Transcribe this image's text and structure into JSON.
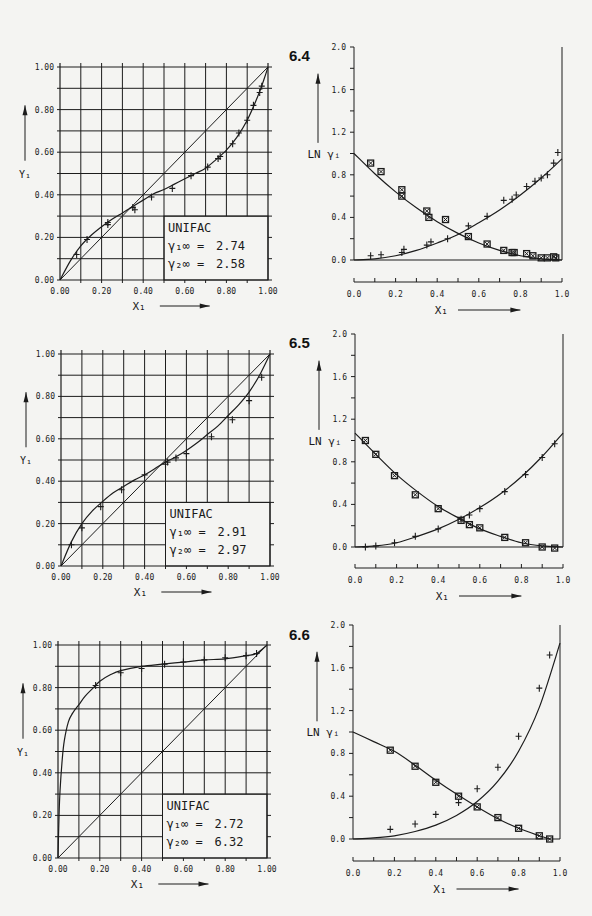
{
  "page": {
    "figures": [
      "6.4",
      "6.5",
      "6.6"
    ]
  },
  "chart_data": [
    {
      "id": "6.4-xy",
      "figure": "6.4",
      "type": "line",
      "title": "",
      "xlabel": "X₁",
      "ylabel": "Y₁",
      "xlim": [
        0,
        1
      ],
      "ylim": [
        0,
        1
      ],
      "grid": true,
      "xticks": [
        "0.00",
        "0.20",
        "0.40",
        "0.60",
        "0.80",
        "1.00"
      ],
      "yticks": [
        "0.00",
        "0.20",
        "0.40",
        "0.60",
        "0.80",
        "1.00"
      ],
      "annotation": {
        "method": "UNIFAC",
        "gamma1_inf_label": "γ₁∞ =",
        "gamma1_inf": "2.74",
        "gamma2_inf_label": "γ₂∞ =",
        "gamma2_inf": "2.58",
        "position": "bottom-right"
      },
      "series": [
        {
          "name": "diagonal",
          "kind": "line",
          "x": [
            0,
            1
          ],
          "y": [
            0,
            1
          ]
        },
        {
          "name": "UNIFAC",
          "kind": "curve",
          "x": [
            0,
            0.05,
            0.1,
            0.15,
            0.2,
            0.25,
            0.3,
            0.35,
            0.4,
            0.45,
            0.5,
            0.55,
            0.6,
            0.65,
            0.7,
            0.75,
            0.8,
            0.85,
            0.9,
            0.95,
            0.98,
            1.0
          ],
          "y": [
            0,
            0.09,
            0.16,
            0.21,
            0.25,
            0.285,
            0.315,
            0.345,
            0.375,
            0.405,
            0.425,
            0.45,
            0.475,
            0.5,
            0.525,
            0.565,
            0.61,
            0.67,
            0.75,
            0.86,
            0.94,
            1.0
          ]
        },
        {
          "name": "experimental",
          "kind": "points",
          "marker": "plus",
          "x": [
            0.08,
            0.13,
            0.23,
            0.23,
            0.35,
            0.36,
            0.44,
            0.54,
            0.63,
            0.71,
            0.76,
            0.77,
            0.83,
            0.86,
            0.9,
            0.93,
            0.96,
            0.97
          ],
          "y": [
            0.12,
            0.19,
            0.26,
            0.27,
            0.34,
            0.33,
            0.39,
            0.43,
            0.49,
            0.53,
            0.57,
            0.58,
            0.64,
            0.69,
            0.75,
            0.82,
            0.88,
            0.91
          ]
        }
      ]
    },
    {
      "id": "6.4-lngamma",
      "figure": "6.4",
      "type": "scatter",
      "title": "",
      "xlabel": "X₁",
      "ylabel": "LN γᵢ",
      "xlim": [
        0,
        1
      ],
      "ylim": [
        0,
        2
      ],
      "grid": false,
      "xticks": [
        "0.0",
        "0.2",
        "0.4",
        "0.6",
        "0.8",
        "1.0"
      ],
      "yticks": [
        "0.0",
        "0.4",
        "0.8",
        "1.2",
        "1.6",
        "2.0"
      ],
      "series": [
        {
          "name": "ln gamma1 UNIFAC",
          "kind": "curve",
          "x": [
            0,
            0.1,
            0.2,
            0.3,
            0.4,
            0.5,
            0.6,
            0.7,
            0.8,
            0.9,
            1.0
          ],
          "y": [
            1.0,
            0.81,
            0.64,
            0.49,
            0.36,
            0.25,
            0.16,
            0.09,
            0.04,
            0.01,
            0.0
          ]
        },
        {
          "name": "ln gamma2 UNIFAC",
          "kind": "curve",
          "x": [
            0,
            0.1,
            0.2,
            0.3,
            0.4,
            0.5,
            0.6,
            0.7,
            0.8,
            0.9,
            1.0
          ],
          "y": [
            0.0,
            0.01,
            0.04,
            0.09,
            0.16,
            0.24,
            0.35,
            0.47,
            0.61,
            0.77,
            0.95
          ]
        },
        {
          "name": "ln gamma1 experimental",
          "kind": "points",
          "marker": "box",
          "x": [
            0.08,
            0.13,
            0.23,
            0.23,
            0.35,
            0.36,
            0.44,
            0.55,
            0.64,
            0.72,
            0.76,
            0.77,
            0.83,
            0.86,
            0.9,
            0.93,
            0.96,
            0.97
          ],
          "y": [
            0.91,
            0.83,
            0.66,
            0.6,
            0.46,
            0.4,
            0.38,
            0.22,
            0.15,
            0.09,
            0.07,
            0.07,
            0.06,
            0.04,
            0.02,
            0.02,
            0.03,
            0.02
          ]
        },
        {
          "name": "ln gamma2 experimental",
          "kind": "points",
          "marker": "plus",
          "x": [
            0.08,
            0.13,
            0.23,
            0.24,
            0.35,
            0.37,
            0.45,
            0.55,
            0.64,
            0.72,
            0.76,
            0.78,
            0.83,
            0.87,
            0.9,
            0.93,
            0.96,
            0.98
          ],
          "y": [
            0.04,
            0.05,
            0.07,
            0.1,
            0.14,
            0.17,
            0.2,
            0.32,
            0.41,
            0.56,
            0.57,
            0.61,
            0.69,
            0.74,
            0.77,
            0.8,
            0.91,
            1.01
          ]
        }
      ]
    },
    {
      "id": "6.5-xy",
      "figure": "6.5",
      "type": "line",
      "title": "",
      "xlabel": "X₁",
      "ylabel": "Y₁",
      "xlim": [
        0,
        1
      ],
      "ylim": [
        0,
        1
      ],
      "grid": true,
      "xticks": [
        "0.00",
        "0.20",
        "0.40",
        "0.60",
        "0.80",
        "1.00"
      ],
      "yticks": [
        "0.00",
        "0.20",
        "0.40",
        "0.60",
        "0.80",
        "1.00"
      ],
      "annotation": {
        "method": "UNIFAC",
        "gamma1_inf_label": "γ₁∞ =",
        "gamma1_inf": "2.91",
        "gamma2_inf_label": "γ₂∞ =",
        "gamma2_inf": "2.97",
        "position": "bottom-right"
      },
      "series": [
        {
          "name": "diagonal",
          "kind": "line",
          "x": [
            0,
            1
          ],
          "y": [
            0,
            1
          ]
        },
        {
          "name": "UNIFAC",
          "kind": "curve",
          "x": [
            0,
            0.05,
            0.1,
            0.15,
            0.2,
            0.25,
            0.3,
            0.35,
            0.4,
            0.45,
            0.5,
            0.55,
            0.6,
            0.65,
            0.7,
            0.75,
            0.8,
            0.85,
            0.9,
            0.95,
            1.0
          ],
          "y": [
            0,
            0.115,
            0.2,
            0.26,
            0.305,
            0.345,
            0.375,
            0.405,
            0.43,
            0.46,
            0.49,
            0.515,
            0.545,
            0.58,
            0.62,
            0.66,
            0.71,
            0.76,
            0.82,
            0.9,
            1.0
          ]
        },
        {
          "name": "experimental",
          "kind": "points",
          "marker": "plus",
          "x": [
            0.05,
            0.1,
            0.19,
            0.29,
            0.4,
            0.5,
            0.51,
            0.55,
            0.6,
            0.72,
            0.82,
            0.9,
            0.96
          ],
          "y": [
            0.1,
            0.18,
            0.28,
            0.36,
            0.43,
            0.48,
            0.49,
            0.51,
            0.53,
            0.61,
            0.69,
            0.78,
            0.89
          ]
        }
      ]
    },
    {
      "id": "6.5-lngamma",
      "figure": "6.5",
      "type": "scatter",
      "title": "",
      "xlabel": "X₁",
      "ylabel": "LN γᵢ",
      "xlim": [
        0,
        1
      ],
      "ylim": [
        0,
        2
      ],
      "grid": false,
      "xticks": [
        "0.0",
        "0.2",
        "0.4",
        "0.6",
        "0.8",
        "1.0"
      ],
      "yticks": [
        "0.0",
        "0.4",
        "0.8",
        "1.2",
        "1.6",
        "2.0"
      ],
      "series": [
        {
          "name": "ln gamma1 UNIFAC",
          "kind": "curve",
          "x": [
            0,
            0.1,
            0.2,
            0.3,
            0.4,
            0.5,
            0.6,
            0.7,
            0.8,
            0.9,
            1.0
          ],
          "y": [
            1.07,
            0.87,
            0.68,
            0.52,
            0.38,
            0.27,
            0.17,
            0.1,
            0.04,
            0.01,
            0.0
          ]
        },
        {
          "name": "ln gamma2 UNIFAC",
          "kind": "curve",
          "x": [
            0,
            0.1,
            0.2,
            0.3,
            0.4,
            0.5,
            0.6,
            0.7,
            0.8,
            0.9,
            1.0
          ],
          "y": [
            0.0,
            0.01,
            0.04,
            0.1,
            0.17,
            0.26,
            0.37,
            0.5,
            0.66,
            0.85,
            1.07
          ]
        },
        {
          "name": "ln gamma1 experimental",
          "kind": "points",
          "marker": "box",
          "x": [
            0.05,
            0.1,
            0.19,
            0.29,
            0.4,
            0.51,
            0.55,
            0.6,
            0.72,
            0.82,
            0.9,
            0.96
          ],
          "y": [
            1.0,
            0.87,
            0.67,
            0.49,
            0.36,
            0.25,
            0.21,
            0.18,
            0.09,
            0.04,
            0.0,
            -0.01
          ]
        },
        {
          "name": "ln gamma2 experimental",
          "kind": "points",
          "marker": "plus",
          "x": [
            0.05,
            0.1,
            0.19,
            0.29,
            0.4,
            0.51,
            0.55,
            0.6,
            0.72,
            0.82,
            0.9,
            0.96
          ],
          "y": [
            0.0,
            0.01,
            0.04,
            0.1,
            0.17,
            0.26,
            0.3,
            0.36,
            0.52,
            0.68,
            0.84,
            0.97
          ]
        }
      ]
    },
    {
      "id": "6.6-xy",
      "figure": "6.6",
      "type": "line",
      "title": "",
      "xlabel": "X₁",
      "ylabel": "Y₁",
      "xlim": [
        0,
        1
      ],
      "ylim": [
        0,
        1
      ],
      "grid": true,
      "xticks": [
        "0.00",
        "0.20",
        "0.40",
        "0.60",
        "0.80",
        "1.00"
      ],
      "yticks": [
        "0.00",
        "0.20",
        "0.40",
        "0.60",
        "0.80",
        "1.00"
      ],
      "annotation": {
        "method": "UNIFAC",
        "gamma1_inf_label": "γ₁∞ =",
        "gamma1_inf": "2.72",
        "gamma2_inf_label": "γ₂∞ =",
        "gamma2_inf": "6.32",
        "position": "bottom-right"
      },
      "series": [
        {
          "name": "diagonal",
          "kind": "line",
          "x": [
            0,
            1
          ],
          "y": [
            0,
            1
          ]
        },
        {
          "name": "UNIFAC",
          "kind": "curve",
          "x": [
            0,
            0.005,
            0.01,
            0.02,
            0.03,
            0.05,
            0.07,
            0.1,
            0.13,
            0.17,
            0.2,
            0.25,
            0.3,
            0.4,
            0.5,
            0.6,
            0.7,
            0.8,
            0.9,
            0.95,
            1.0
          ],
          "y": [
            0,
            0.2,
            0.32,
            0.46,
            0.55,
            0.64,
            0.68,
            0.72,
            0.76,
            0.8,
            0.83,
            0.86,
            0.88,
            0.9,
            0.91,
            0.92,
            0.93,
            0.935,
            0.95,
            0.96,
            1.0
          ]
        },
        {
          "name": "experimental",
          "kind": "points",
          "marker": "plus",
          "x": [
            0.18,
            0.3,
            0.4,
            0.51,
            0.6,
            0.7,
            0.8,
            0.9,
            0.95
          ],
          "y": [
            0.81,
            0.87,
            0.89,
            0.91,
            0.92,
            0.93,
            0.94,
            0.95,
            0.96
          ]
        }
      ]
    },
    {
      "id": "6.6-lngamma",
      "figure": "6.6",
      "type": "scatter",
      "title": "",
      "xlabel": "X₁",
      "ylabel": "LN γᵢ",
      "xlim": [
        0,
        1
      ],
      "ylim": [
        0,
        2
      ],
      "grid": false,
      "xticks": [
        "0.0",
        "0.2",
        "0.4",
        "0.6",
        "0.8",
        "1.0"
      ],
      "yticks": [
        "0.0",
        "0.4",
        "0.8",
        "1.2",
        "1.6",
        "2.0"
      ],
      "series": [
        {
          "name": "ln gamma1 UNIFAC",
          "kind": "curve",
          "x": [
            0,
            0.1,
            0.2,
            0.3,
            0.4,
            0.5,
            0.6,
            0.7,
            0.8,
            0.9,
            0.95
          ],
          "y": [
            1.0,
            0.91,
            0.82,
            0.69,
            0.55,
            0.42,
            0.3,
            0.19,
            0.1,
            0.03,
            0.0
          ]
        },
        {
          "name": "ln gamma2 UNIFAC",
          "kind": "curve",
          "x": [
            0,
            0.1,
            0.2,
            0.3,
            0.4,
            0.5,
            0.6,
            0.7,
            0.8,
            0.9,
            1.0
          ],
          "y": [
            0.0,
            0.01,
            0.03,
            0.07,
            0.13,
            0.22,
            0.35,
            0.54,
            0.82,
            1.23,
            1.83
          ]
        },
        {
          "name": "ln gamma1 experimental",
          "kind": "points",
          "marker": "box",
          "x": [
            0.18,
            0.3,
            0.4,
            0.51,
            0.6,
            0.7,
            0.8,
            0.9,
            0.95
          ],
          "y": [
            0.83,
            0.68,
            0.53,
            0.4,
            0.3,
            0.2,
            0.1,
            0.03,
            0.0
          ]
        },
        {
          "name": "ln gamma2 experimental",
          "kind": "points",
          "marker": "plus",
          "x": [
            0.18,
            0.3,
            0.4,
            0.51,
            0.6,
            0.7,
            0.8,
            0.9,
            0.95
          ],
          "y": [
            0.09,
            0.14,
            0.23,
            0.34,
            0.47,
            0.67,
            0.96,
            1.41,
            1.72
          ]
        }
      ]
    }
  ]
}
